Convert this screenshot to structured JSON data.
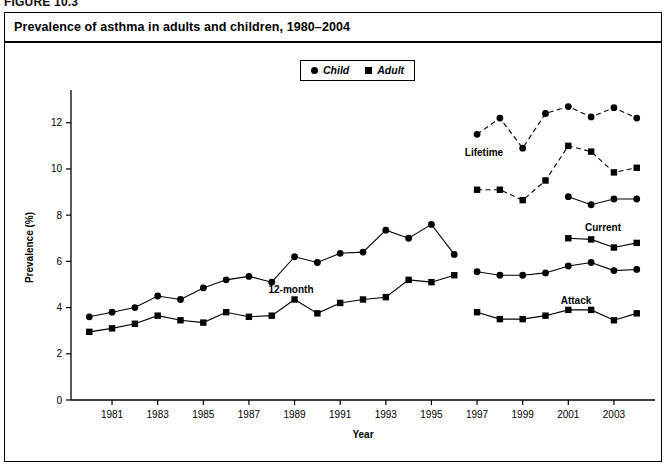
{
  "figure": {
    "number": "FIGURE 10.3"
  },
  "title": "Prevalence of asthma in adults and children, 1980–2004",
  "legend": {
    "items": [
      {
        "label": "Child",
        "marker": "circle-marker"
      },
      {
        "label": "Adult",
        "marker": "square-marker"
      }
    ]
  },
  "annotations": [
    {
      "text": "12-month",
      "x": 291,
      "y": 293
    },
    {
      "text": "Lifetime",
      "x": 484,
      "y": 156
    },
    {
      "text": "Current",
      "x": 603,
      "y": 231
    },
    {
      "text": "Attack",
      "x": 576,
      "y": 304
    }
  ],
  "chart_data": {
    "type": "line",
    "title": "Prevalence of asthma in adults and children, 1980–2004",
    "xlabel": "Year",
    "ylabel": "Prevalence (%)",
    "xlim": [
      1979.2,
      2004.8
    ],
    "ylim": [
      0,
      13.2
    ],
    "yticks": [
      0,
      2,
      4,
      6,
      8,
      10,
      12
    ],
    "xticks": [
      1981,
      1983,
      1985,
      1987,
      1989,
      1991,
      1993,
      1995,
      1997,
      1999,
      2001,
      2003
    ],
    "grid": false,
    "legend_position": "top-center",
    "series": [
      {
        "name": "12-month Child",
        "group": "12-month",
        "who": "Child",
        "marker": "circle",
        "linestyle": "solid",
        "x": [
          1980,
          1981,
          1982,
          1983,
          1984,
          1985,
          1986,
          1987,
          1988,
          1989,
          1990,
          1991,
          1992,
          1993,
          1994,
          1995,
          1996
        ],
        "values": [
          3.6,
          3.8,
          4.0,
          4.5,
          4.35,
          4.85,
          5.2,
          5.35,
          5.1,
          6.2,
          5.95,
          6.35,
          6.4,
          7.35,
          7.0,
          7.6,
          6.3
        ]
      },
      {
        "name": "12-month Adult",
        "group": "12-month",
        "who": "Adult",
        "marker": "square",
        "linestyle": "solid",
        "x": [
          1980,
          1981,
          1982,
          1983,
          1984,
          1985,
          1986,
          1987,
          1988,
          1989,
          1990,
          1991,
          1992,
          1993,
          1994,
          1995,
          1996
        ],
        "values": [
          2.95,
          3.1,
          3.3,
          3.65,
          3.45,
          3.35,
          3.8,
          3.6,
          3.65,
          4.35,
          3.75,
          4.2,
          4.35,
          4.45,
          5.2,
          5.1,
          5.4
        ]
      },
      {
        "name": "Lifetime Child",
        "group": "Lifetime",
        "who": "Child",
        "marker": "circle",
        "linestyle": "dashed",
        "x": [
          1997,
          1998,
          1999,
          2000,
          2001,
          2002,
          2003,
          2004
        ],
        "values": [
          11.5,
          12.2,
          10.9,
          12.4,
          12.7,
          12.25,
          12.65,
          12.2
        ]
      },
      {
        "name": "Lifetime Adult",
        "group": "Lifetime",
        "who": "Adult",
        "marker": "square",
        "linestyle": "dashed",
        "x": [
          1997,
          1998,
          1999,
          2000,
          2001,
          2002,
          2003,
          2004
        ],
        "values": [
          9.1,
          9.1,
          8.65,
          9.5,
          11.0,
          10.75,
          9.85,
          10.05
        ]
      },
      {
        "name": "Current Child",
        "group": "Current",
        "who": "Child",
        "marker": "circle",
        "linestyle": "solid",
        "x": [
          2001,
          2002,
          2003,
          2004
        ],
        "values": [
          8.8,
          8.45,
          8.7,
          8.7
        ]
      },
      {
        "name": "Current Adult",
        "group": "Current",
        "who": "Adult",
        "marker": "square",
        "linestyle": "solid",
        "x": [
          2001,
          2002,
          2003,
          2004
        ],
        "values": [
          7.0,
          6.95,
          6.6,
          6.8
        ]
      },
      {
        "name": "Attack Child",
        "group": "Attack",
        "who": "Child",
        "marker": "circle",
        "linestyle": "solid",
        "x": [
          1997,
          1998,
          1999,
          2000,
          2001,
          2002,
          2003,
          2004
        ],
        "values": [
          5.55,
          5.4,
          5.4,
          5.5,
          5.8,
          5.95,
          5.6,
          5.65
        ]
      },
      {
        "name": "Attack Adult",
        "group": "Attack",
        "who": "Adult",
        "marker": "square",
        "linestyle": "solid",
        "x": [
          1997,
          1998,
          1999,
          2000,
          2001,
          2002,
          2003,
          2004
        ],
        "values": [
          3.8,
          3.5,
          3.5,
          3.65,
          3.9,
          3.9,
          3.45,
          3.75
        ]
      }
    ]
  },
  "colors": {
    "ink": "#000000",
    "background": "#ffffff"
  }
}
